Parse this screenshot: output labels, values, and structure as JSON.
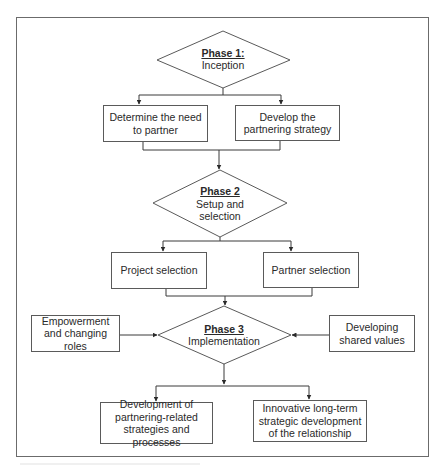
{
  "diagram": {
    "phases": [
      {
        "id": "phase1",
        "title": "Phase 1:",
        "subtitle": "Inception"
      },
      {
        "id": "phase2",
        "title": "Phase 2",
        "subtitle_line1": "Setup and",
        "subtitle_line2": "selection"
      },
      {
        "id": "phase3",
        "title": "Phase 3",
        "subtitle": "Implementation"
      }
    ],
    "boxes": {
      "determine_need": "Determine the need to partner",
      "develop_strategy": "Develop the partnering strategy",
      "project_selection": "Project selection",
      "partner_selection": "Partner selection",
      "empowerment": "Empowerment and changing roles",
      "shared_values": "Developing shared values",
      "development_strategies": "Development of partnering-related strategies and processes",
      "innovative_development": "Innovative long-term strategic development of the relationship"
    },
    "colors": {
      "line": "#3a3a3a",
      "border": "#5a5a5a",
      "text": "#2a2a2a",
      "background": "#ffffff"
    }
  }
}
